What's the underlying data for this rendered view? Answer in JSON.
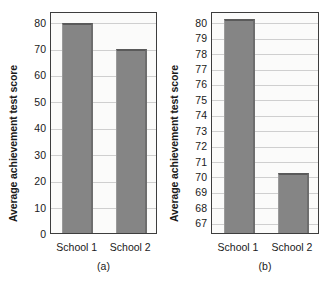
{
  "chart_data": [
    {
      "type": "bar",
      "panel": "(a)",
      "title": "",
      "xlabel": "",
      "ylabel": "Average achievement test score",
      "categories": [
        "School 1",
        "School 2"
      ],
      "values": [
        80.3,
        70.3
      ],
      "ylim": [
        0,
        84
      ],
      "yticks": [
        0,
        10,
        20,
        30,
        40,
        50,
        60,
        70,
        80
      ],
      "ytick_labels": [
        "0",
        "10",
        "20",
        "30",
        "40",
        "50",
        "60",
        "70",
        "80"
      ],
      "grid": true,
      "legend": "none",
      "bar_color": "#858585"
    },
    {
      "type": "bar",
      "panel": "(b)",
      "title": "",
      "xlabel": "",
      "ylabel": "Average achievement test score",
      "categories": [
        "School 1",
        "School 2"
      ],
      "values": [
        80.3,
        70.3
      ],
      "ylim": [
        66.3,
        80.7
      ],
      "yticks": [
        67,
        68,
        69,
        70,
        71,
        72,
        73,
        74,
        75,
        76,
        77,
        78,
        79,
        80
      ],
      "ytick_labels": [
        "67",
        "68",
        "69",
        "70",
        "71",
        "72",
        "73",
        "74",
        "75",
        "76",
        "77",
        "78",
        "79",
        "80"
      ],
      "grid": true,
      "legend": "none",
      "bar_color": "#858585"
    }
  ]
}
